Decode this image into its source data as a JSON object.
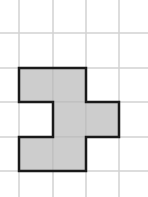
{
  "diagram": {
    "type": "grid-polyomino",
    "grid": {
      "vertical_lines_x": [
        19,
        53,
        86,
        119
      ],
      "horizontal_lines_y": [
        33,
        68,
        102,
        137,
        171
      ],
      "line_color": "#d2d2d2",
      "cell_size": 34
    },
    "shape": {
      "fill": "#cdcdcd",
      "stroke": "#1a1a1a",
      "cells": [
        {
          "row": 1,
          "col": 0
        },
        {
          "row": 1,
          "col": 1
        },
        {
          "row": 2,
          "col": 1
        },
        {
          "row": 2,
          "col": 2
        },
        {
          "row": 3,
          "col": 0
        },
        {
          "row": 3,
          "col": 1
        }
      ],
      "outline_points": "19,68 86,68 86,102 119,102 119,137 86,137 86,171 19,171 19,137 53,137 53,102 19,102"
    }
  }
}
